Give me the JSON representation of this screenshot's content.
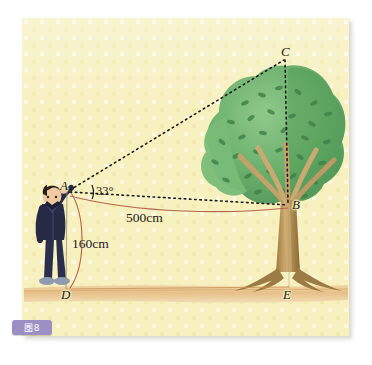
{
  "figure": {
    "badge_label": "圏8",
    "caption_hint": "",
    "background_color": "#f7f0bf",
    "ground_color": "#e9c590",
    "foliage_color": "#5fa864",
    "trunk_color": "#b08a4e",
    "line_color": "#1a1a1a",
    "arc_color": "#b5644f",
    "person_color": "#262a44"
  },
  "points": [
    {
      "id": "A",
      "label": "A",
      "x": 68,
      "y": 189,
      "desc": "eye-level point of observer"
    },
    {
      "id": "B",
      "label": "B",
      "x": 291,
      "y": 206,
      "desc": "point on tree at eye level"
    },
    {
      "id": "C",
      "label": "C",
      "x": 286,
      "y": 56,
      "desc": "top of tree"
    },
    {
      "id": "D",
      "label": "D",
      "x": 66,
      "y": 291,
      "desc": "observer foot on ground"
    },
    {
      "id": "E",
      "label": "E",
      "x": 289,
      "y": 291,
      "desc": "base of tree"
    }
  ],
  "measurements": [
    {
      "id": "height-ad",
      "label": "160cm",
      "x": 76,
      "y": 236,
      "desc": "observer eye height AD"
    },
    {
      "id": "distance-ab",
      "label": "500cm",
      "x": 128,
      "y": 213,
      "desc": "horizontal distance AB"
    }
  ],
  "angle": {
    "label": "33°",
    "value": 33,
    "unit": "degrees",
    "x": 85,
    "y": 190,
    "desc": "angle of elevation at A between AB and AC"
  },
  "segments": [
    {
      "id": "AC",
      "from": "A",
      "to": "C",
      "style": "dotted"
    },
    {
      "id": "AB",
      "from": "A",
      "to": "B",
      "style": "dotted"
    },
    {
      "id": "CB",
      "from": "C",
      "to": "B",
      "style": "dotted"
    }
  ]
}
